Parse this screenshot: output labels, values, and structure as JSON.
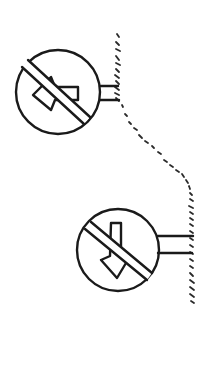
{
  "figure": {
    "stroke_color": "#1a1a1a",
    "background": "#ffffff",
    "signs": [
      {
        "name": "no-left-turn-sign",
        "symbol": "arrow-left",
        "prohibited": true,
        "center": [
          58,
          92
        ],
        "radius": 42
      },
      {
        "name": "no-down-direction-sign",
        "symbol": "arrow-down",
        "prohibited": true,
        "center": [
          118,
          250
        ],
        "radius": 41
      }
    ],
    "wall": {
      "name": "hatched-wall-surface",
      "style": "dashed-hatching"
    }
  }
}
